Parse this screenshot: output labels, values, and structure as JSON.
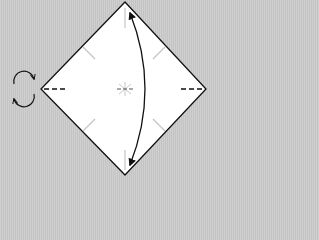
{
  "diagram": {
    "type": "origami-step",
    "background_color": "#c9c9c9",
    "paper_color": "#ffffff",
    "line_color": "#111111",
    "crease_color": "#bdbdbd",
    "paper_shape": "square-as-diamond",
    "vertices": {
      "top": [
        125,
        2
      ],
      "right": [
        206,
        89
      ],
      "bottom": [
        125,
        175
      ],
      "left": [
        41,
        89
      ]
    },
    "symbols": [
      {
        "name": "turn-over-icon",
        "meaning": "turn model over",
        "position": [
          23,
          89
        ]
      },
      {
        "name": "fold-and-unfold-arrow",
        "meaning": "fold top to bottom and unfold",
        "from": [
          129,
          12
        ],
        "to": [
          129,
          165
        ]
      },
      {
        "name": "valley-fold-mark-left",
        "style": "dashed",
        "position": [
          44,
          89
        ]
      },
      {
        "name": "valley-fold-mark-right",
        "style": "dashed",
        "position": [
          190,
          89
        ]
      },
      {
        "name": "center-mark",
        "style": "star-crease",
        "position": [
          125,
          89
        ]
      }
    ]
  }
}
